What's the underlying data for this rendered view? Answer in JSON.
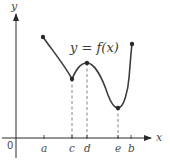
{
  "figure": {
    "function_label": "y = f(x)",
    "axes": {
      "x_label": "x",
      "y_label": "y",
      "origin_label": "0"
    },
    "x_ticks": [
      {
        "label": "a",
        "px": 44
      },
      {
        "label": "c",
        "px": 72
      },
      {
        "label": "d",
        "px": 87
      },
      {
        "label": "e",
        "px": 118
      },
      {
        "label": "b",
        "px": 131
      }
    ],
    "key_points": [
      {
        "name": "left-endpoint",
        "x_label": "a",
        "px": 43,
        "py": 37,
        "dashed": false
      },
      {
        "name": "local-min-c",
        "x_label": "c",
        "px": 72,
        "py": 79,
        "dashed": true
      },
      {
        "name": "local-max-d",
        "x_label": "d",
        "px": 87,
        "py": 63,
        "dashed": true
      },
      {
        "name": "local-min-e",
        "x_label": "e",
        "px": 118,
        "py": 108,
        "dashed": true
      },
      {
        "name": "right-endpoint",
        "x_label": "b",
        "px": 132,
        "py": 44,
        "dashed": false
      }
    ],
    "colors": {
      "curve": "#3d3d3d",
      "axis": "#2a2a2a",
      "dashed": "#777777",
      "labels": "#4a4a4a"
    }
  }
}
